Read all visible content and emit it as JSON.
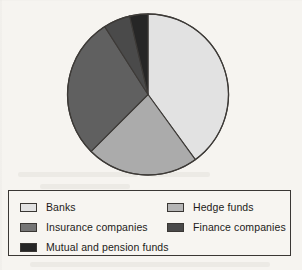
{
  "chart_data": {
    "type": "pie",
    "title": "",
    "subtitle": "",
    "xlabel": "",
    "ylabel": "",
    "grid": false,
    "legend_position": "bottom",
    "start_angle_deg": 0,
    "direction": "clockwise",
    "categories": [
      "Banks",
      "Hedge funds",
      "Insurance companies",
      "Finance companies",
      "Mutual and pension funds"
    ],
    "values": [
      40.0,
      22.5,
      28.5,
      5.3,
      3.7
    ],
    "slices": [
      {
        "label": "Banks",
        "value": 40.0,
        "color": "#e2e2e2",
        "start_angle_deg": 0,
        "end_angle_deg": 144.0
      },
      {
        "label": "Hedge funds",
        "value": 22.5,
        "color": "#ababab",
        "start_angle_deg": 144.0,
        "end_angle_deg": 225.0
      },
      {
        "label": "Insurance companies",
        "value": 28.5,
        "color": "#606060",
        "start_angle_deg": 225.0,
        "end_angle_deg": 327.5
      },
      {
        "label": "Finance companies",
        "value": 5.3,
        "color": "#4a4a4a",
        "start_angle_deg": 327.5,
        "end_angle_deg": 346.8
      },
      {
        "label": "Mutual and pension funds",
        "value": 3.7,
        "color": "#262626",
        "start_angle_deg": 346.8,
        "end_angle_deg": 360.0
      }
    ]
  },
  "legend": {
    "columns": [
      {
        "entries": [
          {
            "label": "Banks",
            "color": "#e2e2e2"
          },
          {
            "label": "Insurance companies",
            "color": "#757575"
          },
          {
            "label": "Mutual and pension funds",
            "color": "#262626"
          }
        ]
      },
      {
        "entries": [
          {
            "label": "Hedge funds",
            "color": "#b5b5b5"
          },
          {
            "label": "Finance companies",
            "color": "#4a4a4a"
          }
        ]
      }
    ]
  },
  "colors": {
    "paper": "#f6f4f0",
    "outline": "#3a3734",
    "text": "#1d1b19"
  }
}
